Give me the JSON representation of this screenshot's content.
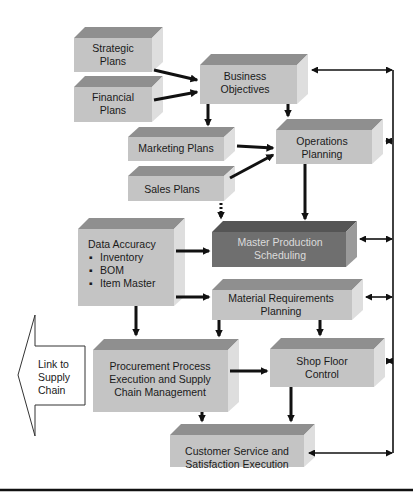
{
  "diagram": {
    "colors": {
      "box_front": "#c4c4c4",
      "box_top": "#8f8f8f",
      "box_side": "#dedede",
      "mps_front": "#6f6f6f",
      "mps_top": "#555555",
      "mps_side": "#9a9a9a",
      "arrow": "#111111",
      "text": "#1a1a1a",
      "mps_text": "#dcdcdc"
    },
    "nodes": {
      "strategic_plans": {
        "line1": "Strategic",
        "line2": "Plans"
      },
      "financial_plans": {
        "line1": "Financial",
        "line2": "Plans"
      },
      "business_objectives": {
        "line1": "Business",
        "line2": "Objectives"
      },
      "marketing_plans": {
        "line1": "Marketing Plans"
      },
      "sales_plans": {
        "line1": "Sales Plans"
      },
      "operations_planning": {
        "line1": "Operations",
        "line2": "Planning"
      },
      "data_accuracy": {
        "title": "Data Accuracy",
        "bullets": [
          "Inventory",
          "BOM",
          "Item Master"
        ]
      },
      "master_production_scheduling": {
        "line1": "Master Production",
        "line2": "Scheduling"
      },
      "material_requirements_planning": {
        "line1": "Material Requirements",
        "line2": "Planning"
      },
      "procurement": {
        "line1": "Procurement Process",
        "line2": "Execution and Supply",
        "line3": "Chain Management"
      },
      "shop_floor_control": {
        "line1": "Shop Floor",
        "line2": "Control"
      },
      "customer_service": {
        "line1": "Customer Service and",
        "line2": "Satisfaction Execution"
      },
      "link_to_supply_chain": {
        "line1": "Link to",
        "line2": "Supply",
        "line3": "Chain"
      }
    },
    "bullet_glyph": "▪",
    "edges": [
      {
        "from": "Strategic Plans",
        "to": "Business Objectives"
      },
      {
        "from": "Financial Plans",
        "to": "Business Objectives"
      },
      {
        "from": "Business Objectives",
        "to": "Marketing Plans"
      },
      {
        "from": "Business Objectives",
        "to": "Operations Planning"
      },
      {
        "from": "Marketing Plans",
        "to": "Operations Planning"
      },
      {
        "from": "Sales Plans",
        "to": "Operations Planning"
      },
      {
        "from": "Sales Plans",
        "to": "Master Production Scheduling",
        "style": "dotted"
      },
      {
        "from": "Operations Planning",
        "to": "Master Production Scheduling"
      },
      {
        "from": "Data Accuracy",
        "to": "Master Production Scheduling"
      },
      {
        "from": "Data Accuracy",
        "to": "Material Requirements Planning"
      },
      {
        "from": "Data Accuracy",
        "to": "Procurement Process Execution and Supply Chain Management"
      },
      {
        "from": "Material Requirements Planning",
        "to": "Procurement Process Execution and Supply Chain Management"
      },
      {
        "from": "Material Requirements Planning",
        "to": "Shop Floor Control"
      },
      {
        "from": "Procurement Process Execution and Supply Chain Management",
        "to": "Shop Floor Control"
      },
      {
        "from": "Procurement Process Execution and Supply Chain Management",
        "to": "Customer Service and Satisfaction Execution"
      },
      {
        "from": "Shop Floor Control",
        "to": "Customer Service and Satisfaction Execution"
      },
      {
        "feedback_bus": [
          "Business Objectives",
          "Operations Planning",
          "Master Production Scheduling",
          "Material Requirements Planning",
          "Shop Floor Control",
          "Customer Service and Satisfaction Execution"
        ],
        "style": "bidirectional"
      }
    ]
  }
}
